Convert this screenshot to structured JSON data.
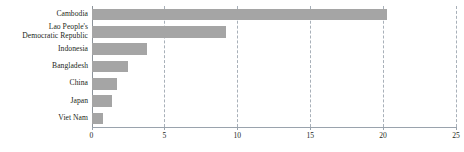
{
  "chart_data": {
    "type": "bar",
    "orientation": "horizontal",
    "title": "",
    "subtitle": "",
    "xlabel": "",
    "ylabel": "",
    "categories": [
      "Cambodia",
      "Lao People's Democratic Republic",
      "Indonesia",
      "Bangladesh",
      "China",
      "Japan",
      "Viet Nam"
    ],
    "category_lines": [
      [
        "Cambodia"
      ],
      [
        "Lao People's",
        "Democratic Republic"
      ],
      [
        "Indonesia"
      ],
      [
        "Bangladesh"
      ],
      [
        "China"
      ],
      [
        "Japan"
      ],
      [
        "Viet Nam"
      ]
    ],
    "values": [
      20.3,
      9.2,
      3.8,
      2.5,
      1.75,
      1.4,
      0.8
    ],
    "xlim": [
      0,
      25
    ],
    "xticks": [
      0,
      5,
      10,
      15,
      20,
      25
    ],
    "xtick_labels": [
      "0",
      "5",
      "10",
      "15",
      "20",
      "25"
    ],
    "grid": {
      "vertical": true,
      "horizontal": false,
      "style": "dashed",
      "color": "#9aa3ad"
    },
    "legend": {
      "visible": false,
      "position": "none",
      "entries": []
    },
    "series": [
      {
        "name": "value",
        "color": "#a5a5a5",
        "values": [
          20.3,
          9.2,
          3.8,
          2.5,
          1.75,
          1.4,
          0.8
        ]
      }
    ],
    "colors": {
      "bar": "#a5a5a5",
      "gridline": "#9aa3ad",
      "axis": "#9aa3ad",
      "text": "#231f20",
      "background": "#ffffff"
    }
  }
}
